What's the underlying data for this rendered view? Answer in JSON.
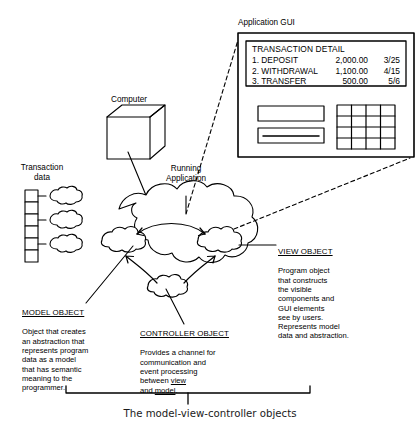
{
  "diagram": {
    "caption": "The model-view-controller objects",
    "nodes": {
      "computer": "Computer",
      "transaction_data_line1": "Transaction",
      "transaction_data_line2": "data",
      "running_app_line1": "Running",
      "running_app_line2": "Application",
      "gui_title": "Application GUI"
    },
    "gui_panel": {
      "title": "TRANSACTION DETAIL",
      "rows": [
        {
          "label": "1. DEPOSIT",
          "amount": "2,000.00",
          "date": "3/25"
        },
        {
          "label": "2. WITHDRAWAL",
          "amount": "1,100.00",
          "date": "4/15"
        },
        {
          "label": "3. TRANSFER",
          "amount": "500.00",
          "date": "5/6"
        }
      ],
      "widgets": {
        "text_field": "",
        "progress_field": "",
        "keypad_rows": 4,
        "keypad_cols": 4
      }
    },
    "objects": {
      "model": {
        "heading": "MODEL OBJECT",
        "body": "Object that creates\nan abstraction that\nrepresents program\ndata as a model\nthat has semantic\nmeaning to the\nprogrammer."
      },
      "controller": {
        "heading": "CONTROLLER OBJECT",
        "body_part1": "Provides a channel for\ncommunication and\nevent processing\nbetween ",
        "body_view": "view",
        "body_part2": "\nand ",
        "body_model": "model",
        "body_part3": "."
      },
      "view": {
        "heading": "VIEW OBJECT",
        "body": "Program object\nthat constructs\nthe visible\ncomponents and\nGUI elements\nsee by users.\nRepresents model\ndata and abstraction."
      }
    },
    "colors": {
      "stroke": "#000000",
      "background": "#ffffff",
      "caption_text": "#1a1a1a"
    }
  }
}
